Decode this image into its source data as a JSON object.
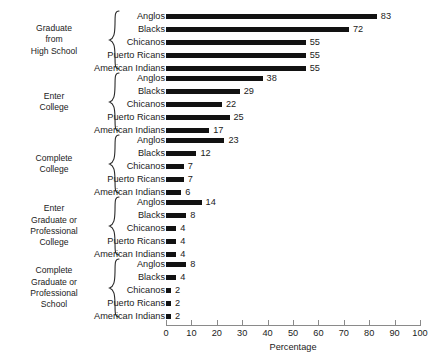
{
  "chart_data": {
    "type": "bar",
    "title": "",
    "xlabel": "Percentage",
    "ylabel": "",
    "xlim": [
      0,
      100
    ],
    "orientation": "horizontal",
    "grid": false,
    "legend": "none",
    "xticks": [
      0,
      10,
      20,
      30,
      40,
      50,
      60,
      70,
      80,
      90,
      100
    ],
    "categories": [
      "Anglos",
      "Blacks",
      "Chicanos",
      "Puerto Ricans",
      "American Indians"
    ],
    "groups": [
      {
        "label": "Graduate\nfrom\nHigh School",
        "categories": [
          "Anglos",
          "Blacks",
          "Chicanos",
          "Puerto Ricans",
          "American Indians"
        ],
        "values": [
          83,
          72,
          55,
          55,
          55
        ]
      },
      {
        "label": "Enter\nCollege",
        "categories": [
          "Anglos",
          "Blacks",
          "Chicanos",
          "Puerto Ricans",
          "American Indians"
        ],
        "values": [
          38,
          29,
          22,
          25,
          17
        ]
      },
      {
        "label": "Complete\nCollege",
        "categories": [
          "Anglos",
          "Blacks",
          "Chicanos",
          "Puerto Ricans",
          "American Indians"
        ],
        "values": [
          23,
          12,
          7,
          7,
          6
        ]
      },
      {
        "label": "Enter\nGraduate or\nProfessional\nCollege",
        "categories": [
          "Anglos",
          "Blacks",
          "Chicanos",
          "Puerto Ricans",
          "American Indians"
        ],
        "values": [
          14,
          8,
          4,
          4,
          4
        ]
      },
      {
        "label": "Complete\nGraduate or\nProfessional\nSchool",
        "categories": [
          "Anglos",
          "Blacks",
          "Chicanos",
          "Puerto Ricans",
          "American Indians"
        ],
        "values": [
          8,
          4,
          2,
          2,
          2
        ]
      }
    ],
    "colors": {
      "bar": "#121212",
      "axis": "#8a8a8a",
      "text": "#1b1b1b",
      "background": "#ffffff"
    }
  }
}
